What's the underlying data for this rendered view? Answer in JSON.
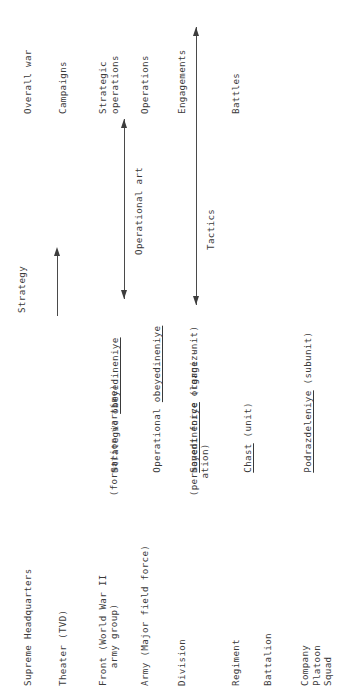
{
  "diagram": {
    "orientation": "rotated-90-ccw",
    "background_color": "#ffffff",
    "text_color": "#3a3a3a",
    "line_color": "#4a4a4a"
  },
  "echelons": [
    {
      "id": "supreme-headquarters",
      "lines": [
        "Supreme Headquarters"
      ]
    },
    {
      "id": "theater",
      "lines": [
        "Theater (TVD)"
      ]
    },
    {
      "id": "front",
      "lines": [
        "Front (World War II",
        "   army group)"
      ]
    },
    {
      "id": "army",
      "lines": [
        "Army (Major field force)"
      ]
    },
    {
      "id": "division",
      "lines": [
        "Division"
      ]
    },
    {
      "id": "regiment",
      "lines": [
        "Regiment"
      ]
    },
    {
      "id": "battalion",
      "lines": [
        "Battalion"
      ]
    },
    {
      "id": "company-platoon-squad",
      "lines": [
        "Company",
        "Platoon",
        "Squad"
      ]
    }
  ],
  "russian_terms": [
    {
      "id": "strategic-obeyedineniye",
      "prefix": "Strategic ",
      "term": "obeyedineniye",
      "suffix": "",
      "sublines": [
        "  (formation wartime)"
      ]
    },
    {
      "id": "operational-obeyedineniye",
      "prefix": "Operational ",
      "term": "obeyedineniye",
      "suffix": "",
      "sublines": []
    },
    {
      "id": "soyedineniye",
      "prefix": "",
      "term": "Soyedineniye",
      "suffix": " (large unit)",
      "sublines": [
        "  (permanent force organiz-",
        "     ation)"
      ]
    },
    {
      "id": "chast",
      "prefix": "",
      "term": "Chast",
      "suffix": " (unit)",
      "sublines": []
    },
    {
      "id": "podrazdeleniye",
      "prefix": "",
      "term": "Podrazdeleniye",
      "suffix": " (subunit)",
      "sublines": []
    }
  ],
  "levels_of_war": [
    {
      "id": "strategy",
      "label": "Strategy"
    },
    {
      "id": "operational-art",
      "label": "Operational art"
    },
    {
      "id": "tactics",
      "label": "Tactics"
    }
  ],
  "activities": [
    {
      "id": "overall-war",
      "lines": [
        "Overall war"
      ]
    },
    {
      "id": "campaigns",
      "lines": [
        "Campaigns"
      ]
    },
    {
      "id": "strategic-operations",
      "lines": [
        "Strategic",
        "operations"
      ]
    },
    {
      "id": "operations",
      "lines": [
        "Operations"
      ]
    },
    {
      "id": "engagements",
      "lines": [
        "Engagements"
      ]
    },
    {
      "id": "battles",
      "lines": [
        "Battles"
      ]
    }
  ]
}
